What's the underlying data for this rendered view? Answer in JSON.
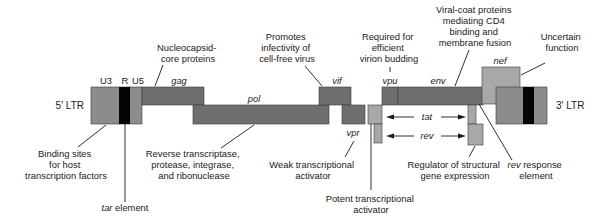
{
  "diagram": {
    "ltr5": {
      "label": "5' LTR",
      "regions": [
        "U3",
        "R",
        "U5"
      ]
    },
    "ltr3": {
      "label": "3' LTR"
    },
    "genes": {
      "gag": "gag",
      "pol": "pol",
      "vif": "vif",
      "vpr": "vpr",
      "vpu": "vpu",
      "env": "env",
      "nef": "nef",
      "tat": "tat",
      "rev": "rev"
    },
    "annotations": {
      "gag": [
        "Nucleocapsid-",
        "core proteins"
      ],
      "vif": [
        "Promotes",
        "infectivity of",
        "cell-free virus"
      ],
      "vpu": [
        "Required for",
        "efficient",
        "virion budding"
      ],
      "env": [
        "Viral-coat proteins",
        "mediating CD4",
        "binding and",
        "membrane fusion"
      ],
      "nef": [
        "Uncertain",
        "function"
      ],
      "ltr": [
        "Binding sites",
        "for host",
        "transcription factors"
      ],
      "tar_italic": "tar",
      "tar_rest": " element",
      "pol": [
        "Reverse transcriptase,",
        "protease, integrase,",
        "and ribonuclease"
      ],
      "vpr": [
        "Weak transcriptional",
        "activator"
      ],
      "tat": [
        "Potent transcriptional",
        "activator"
      ],
      "rev": [
        "Regulator of structural",
        "gene expression"
      ],
      "rre_italic": "rev",
      "rre_rest": " response",
      "rre_line2": "element"
    },
    "colors": {
      "dark_gene": "#6f6f6f",
      "light_gene": "#a8a8a8",
      "ltr_box": "#8c8c8c",
      "r_region": "#050505"
    }
  }
}
